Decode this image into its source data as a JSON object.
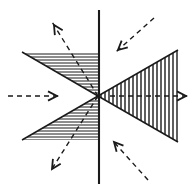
{
  "figure": {
    "type": "vector-field-diagram",
    "canvas": {
      "width": 196,
      "height": 193,
      "background": "#ffffff"
    },
    "origin": {
      "x": 98,
      "y": 96,
      "label": "origin"
    },
    "colors": {
      "stroke": "#1a1a1a",
      "hatch": "#1a1a1a",
      "dashed": "#1a1a1a",
      "background": "#ffffff"
    },
    "solid_lines": [
      {
        "name": "vertical-axis-line",
        "x1": 99,
        "y1": 10,
        "x2": 99,
        "y2": 184,
        "width": 2.1,
        "description": "vertical solid line through origin"
      },
      {
        "name": "left-wedge-upper-edge",
        "x1": 22,
        "y1": 52,
        "x2": 98,
        "y2": 96,
        "width": 1.5,
        "description": "upper boundary of left hatched wedge"
      },
      {
        "name": "left-wedge-lower-edge",
        "x1": 22,
        "y1": 140,
        "x2": 98,
        "y2": 96,
        "width": 1.5,
        "description": "lower boundary of left hatched wedge"
      },
      {
        "name": "right-wedge-upper-edge",
        "x1": 98,
        "y1": 96,
        "x2": 178,
        "y2": 50,
        "width": 1.5,
        "description": "upper boundary of right hatched wedge"
      },
      {
        "name": "right-wedge-lower-edge",
        "x1": 98,
        "y1": 96,
        "x2": 178,
        "y2": 142,
        "width": 1.5,
        "description": "lower boundary of right hatched wedge"
      }
    ],
    "hatched_regions": [
      {
        "name": "upper-left-sector",
        "hatch_direction": "horizontal",
        "hatch_spacing": 3,
        "hatch_width": 1,
        "polygon": "22,52 99,52 99,96 98,96",
        "description": "upper-left triangular sector with horizontal hatching"
      },
      {
        "name": "lower-left-sector",
        "hatch_direction": "horizontal",
        "hatch_spacing": 3,
        "hatch_width": 1,
        "polygon": "98,96 99,96 99,140 22,140",
        "description": "lower-left triangular sector with horizontal hatching"
      },
      {
        "name": "upper-right-sector",
        "hatch_direction": "vertical",
        "hatch_spacing": 4,
        "hatch_width": 1.4,
        "polygon": "98,96 178,50 178,96",
        "description": "upper-right triangular sector with vertical hatching"
      },
      {
        "name": "lower-right-sector",
        "hatch_direction": "vertical",
        "hatch_spacing": 4,
        "hatch_width": 1.4,
        "polygon": "98,96 178,96 178,142",
        "description": "lower-right triangular sector with vertical hatching"
      }
    ],
    "dashed_arrows": [
      {
        "name": "arrow-horizontal-left-inward",
        "x1": 8,
        "y1": 96,
        "x2": 62,
        "y2": 96,
        "head_at": {
          "x": 57,
          "y": 96
        },
        "direction": "right",
        "flow": "inward",
        "dash": "5,4"
      },
      {
        "name": "arrow-horizontal-right-outward",
        "x1": 110,
        "y1": 96,
        "x2": 189,
        "y2": 96,
        "head_at": {
          "x": 186,
          "y": 96
        },
        "direction": "right",
        "flow": "outward",
        "dash": "5,4"
      },
      {
        "name": "arrow-upper-left-outward",
        "x1": 98,
        "y1": 96,
        "x2": 52,
        "y2": 22,
        "head_at": {
          "x": 54,
          "y": 25
        },
        "direction": "up-left",
        "flow": "outward",
        "dash": "5,4"
      },
      {
        "name": "arrow-lower-left-outward",
        "x1": 98,
        "y1": 96,
        "x2": 50,
        "y2": 172,
        "head_at": {
          "x": 52,
          "y": 169
        },
        "direction": "down-left",
        "flow": "outward",
        "dash": "5,4"
      },
      {
        "name": "arrow-upper-right-inward",
        "x1": 154,
        "y1": 18,
        "x2": 116,
        "y2": 52,
        "head_at": {
          "x": 118,
          "y": 50
        },
        "direction": "down-left",
        "flow": "inward",
        "dash": "5,4"
      },
      {
        "name": "arrow-lower-right-inward",
        "x1": 148,
        "y1": 180,
        "x2": 112,
        "y2": 140,
        "head_at": {
          "x": 114,
          "y": 142
        },
        "direction": "up-left",
        "flow": "inward",
        "dash": "5,4"
      }
    ]
  }
}
